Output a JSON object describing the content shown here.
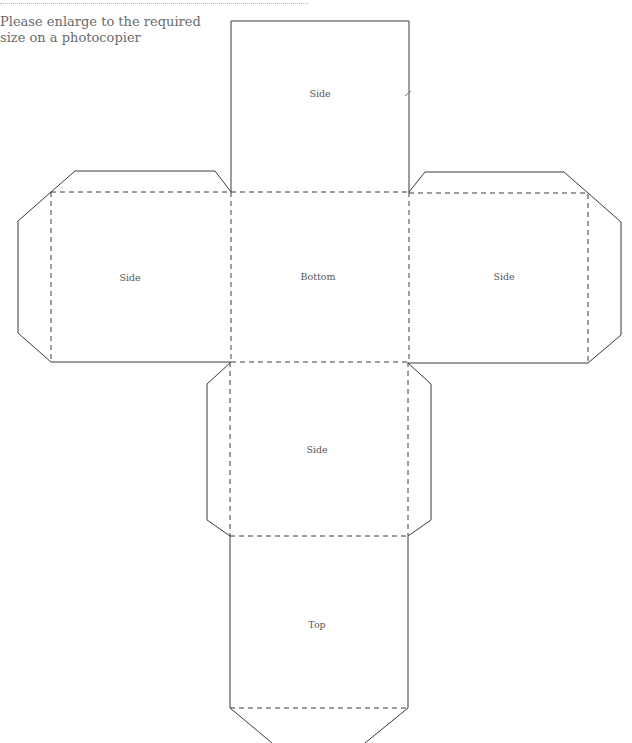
{
  "instruction": {
    "line1": "Please enlarge to the required",
    "line2": "size on a photocopier"
  },
  "panels": {
    "top_side": {
      "label": "Side"
    },
    "left_side": {
      "label": "Side"
    },
    "bottom": {
      "label": "Bottom"
    },
    "right_side": {
      "label": "Side"
    },
    "middle_side": {
      "label": "Side"
    },
    "top": {
      "label": "Top"
    }
  },
  "colors": {
    "line": "#3a3a3a",
    "text": "#555555"
  }
}
